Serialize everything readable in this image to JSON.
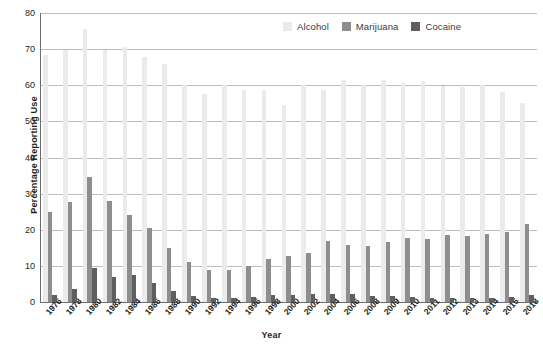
{
  "chart_data": {
    "type": "bar",
    "title": "",
    "xlabel": "Year",
    "ylabel": "Percentage Reporting Use",
    "ylim": [
      0,
      80
    ],
    "yticks": [
      0,
      10,
      20,
      30,
      40,
      50,
      60,
      70,
      80
    ],
    "grid": true,
    "legend_position": "top-right",
    "categories": [
      "1976",
      "1978",
      "1980",
      "1982",
      "1984",
      "1986",
      "1988",
      "1990",
      "1992",
      "1994",
      "1996",
      "1998",
      "2000",
      "2002",
      "2004",
      "2006",
      "2008",
      "2009",
      "2010",
      "2011",
      "2012",
      "2013",
      "2014",
      "2015",
      "2018"
    ],
    "series": [
      {
        "name": "Alcohol",
        "color": "#ebebeb",
        "values": [
          68.3,
          69.7,
          75.5,
          69.7,
          70.7,
          67.8,
          66.0,
          60.0,
          57.6,
          60.0,
          58.8,
          58.8,
          54.5,
          60.2,
          58.8,
          61.5,
          60.0,
          61.5,
          60.5,
          61.2,
          59.8,
          59.5,
          60.0,
          58.0,
          55.0
        ]
      },
      {
        "name": "Marijuana",
        "color": "#8e8e8e",
        "values": [
          25.0,
          27.8,
          34.5,
          28.0,
          24.0,
          20.5,
          15.0,
          11.0,
          9.0,
          9.0,
          10.0,
          11.8,
          12.6,
          13.5,
          16.8,
          15.8,
          15.5,
          16.5,
          17.8,
          17.5,
          18.5,
          18.3,
          18.8,
          19.3,
          21.5
        ]
      },
      {
        "name": "Cocaine",
        "color": "#5f5f5f",
        "values": [
          2.0,
          3.5,
          9.5,
          7.0,
          7.5,
          5.3,
          3.0,
          1.8,
          1.2,
          1.2,
          1.4,
          2.0,
          2.0,
          2.2,
          2.3,
          2.2,
          1.8,
          1.7,
          1.5,
          1.2,
          1.1,
          1.2,
          1.2,
          1.3,
          2.0
        ]
      }
    ]
  }
}
